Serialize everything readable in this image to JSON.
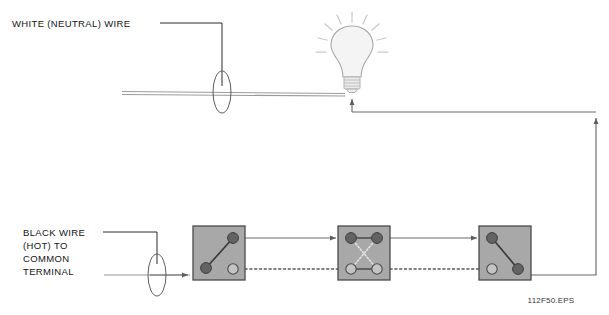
{
  "diagram": {
    "caption": "112F50.EPS",
    "background_color": "#ffffff",
    "labels": {
      "neutral_wire": "WHITE (NEUTRAL) WIRE",
      "hot_wire_lines": [
        "BLACK WIRE",
        "(HOT) TO",
        "COMMON",
        "TERMINAL"
      ],
      "hot_wire_line_1": "BLACK WIRE",
      "hot_wire_line_2": "(HOT) TO",
      "hot_wire_line_3": "COMMON",
      "hot_wire_line_4": "TERMINAL"
    },
    "colors": {
      "switch_body": "#a8a8a8",
      "switch_border": "#4a4a4a",
      "terminal_filled": "#636363",
      "terminal_open": "#c4c4c4",
      "wire": "#6b6b6b",
      "cable": "#9a9a9a",
      "leader": "#2b2b2b",
      "bulb_glass": "#f4f4f4",
      "bulb_ray": "#c9c9c9",
      "text": "#141414",
      "caption_text": "#3a3a3a"
    },
    "components": {
      "lamp": {
        "name": "light-bulb",
        "ray_count": 9,
        "center_x": 352,
        "center_y": 52
      },
      "switch_1": {
        "name": "three-way-switch-left",
        "type": "3-way",
        "x": 193,
        "y": 226,
        "width": 52,
        "height": 54,
        "terminals": [
          "common-bottom-left",
          "traveler-top-right",
          "traveler-bottom-right-open"
        ]
      },
      "switch_2": {
        "name": "four-way-switch-middle",
        "type": "4-way",
        "x": 338,
        "y": 226,
        "width": 52,
        "height": 54,
        "terminals": [
          "top-left",
          "top-right",
          "bottom-left-open",
          "bottom-right-open"
        ]
      },
      "switch_3": {
        "name": "three-way-switch-right",
        "type": "3-way",
        "x": 479,
        "y": 226,
        "width": 52,
        "height": 54,
        "terminals": [
          "traveler-top-left",
          "traveler-bottom-left-open",
          "common-bottom-right"
        ]
      },
      "splice_neutral": {
        "name": "neutral-wire-splice",
        "cx": 222,
        "cy": 92
      },
      "splice_hot": {
        "name": "hot-wire-splice",
        "cx": 157,
        "cy": 275
      }
    }
  }
}
